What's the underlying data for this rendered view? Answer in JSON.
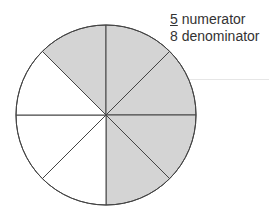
{
  "fraction": {
    "numerator": "5",
    "denominator": "8",
    "numerator_label": "numerator",
    "denominator_label": "denominator"
  },
  "circle": {
    "total_sectors": 8,
    "shaded_sectors": 5,
    "shaded_color": "#d4d4d4",
    "unshaded_color": "#ffffff",
    "stroke_color": "#444444"
  }
}
